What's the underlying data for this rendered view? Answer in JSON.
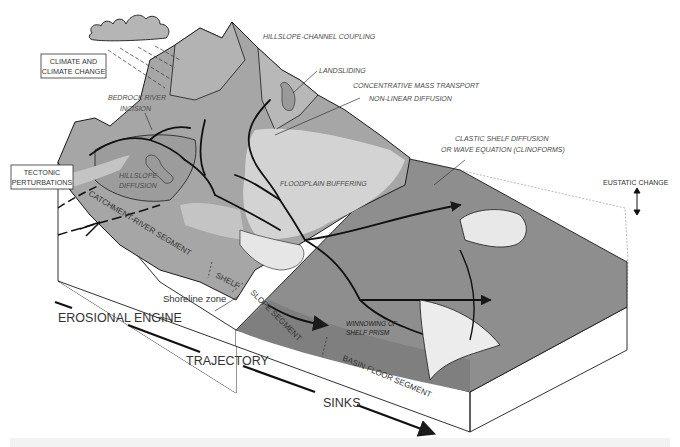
{
  "diagram": {
    "type": "source-to-sink block diagram",
    "colors": {
      "mountain_dark": "#a6a6a6",
      "mountain_light": "#c9c9c9",
      "floodplain": "#d3d3d3",
      "fan_light": "#ececec",
      "basin_dark": "#8e8e8e",
      "block_side": "#ffffff",
      "line": "#1a1a1a",
      "cloud": "#b5b5b5"
    },
    "boxed_labels": {
      "climate": [
        "CLIMATE AND",
        "CLIMATE CHANGE"
      ],
      "tectonic": [
        "TECTONIC",
        "PERTURBATIONS"
      ]
    },
    "process_labels": {
      "hillslope_channel_coupling": "HILLSLOPE-CHANNEL COUPLING",
      "landsliding": "LANDSLIDING",
      "concentrative_mass_transport": "CONCENTRATIVE MASS TRANSPORT",
      "non_linear_diffusion": "NON-LINEAR DIFFUSION",
      "bedrock_river_incision": [
        "BEDROCK RIVER",
        "INCISION"
      ],
      "hillslope_diffusion": [
        "HILLSLOPE",
        "DIFFUSION"
      ],
      "floodplain_buffering": "FLOODPLAIN BUFFERING",
      "clastic_shelf_diffusion": [
        "CLASTIC SHELF DIFFUSION",
        "OR WAVE EQUATION (CLINOFORMS)"
      ],
      "winnowing": [
        "WINNOWING OF",
        "SHELF PRISM"
      ],
      "eustatic_change": "EUSTATIC CHANGE"
    },
    "segment_labels": {
      "catchment_river": "CATCHMENT-RIVER SEGMENT",
      "shelf": "SHELF",
      "shoreline_zone": "Shoreline zone",
      "slope": "SLOPE SEGMENT",
      "basin_floor": "BASIN FLOOR SEGMENT"
    },
    "axis_labels": {
      "erosional_engine": "EROSIONAL ENGINE",
      "trajectory": "TRAJECTORY",
      "sinks": "SINKS"
    }
  }
}
